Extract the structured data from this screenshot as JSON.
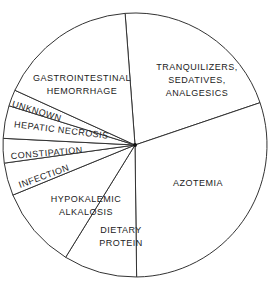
{
  "chart_data": {
    "type": "pie",
    "title": "",
    "center": [
      135,
      145
    ],
    "radius": 132,
    "start_angle_deg": 94.3,
    "direction": "clockwise",
    "categories": [
      "Tranquilizers, sedatives, analgesics",
      "Azotemia",
      "Dietary protein",
      "Hypokalemic alkalosis",
      "Infection",
      "Constipation",
      "Hepatic necrosis",
      "Unknown",
      "Gastrointestinal hemorrhage"
    ],
    "values": [
      21,
      30,
      9,
      10,
      4,
      3,
      4,
      2,
      17
    ],
    "value_unit": "approx. percent of cases (estimated from slice angles)",
    "legend": "none (labels inside slices)",
    "labels": [
      {
        "lines": [
          "TRANQUILIZERS,",
          "SEDATIVES,",
          "ANALGESICS"
        ],
        "x": 197,
        "y": 70,
        "rotate": 0
      },
      {
        "lines": [
          "AZOTEMIA"
        ],
        "x": 198,
        "y": 186,
        "rotate": 0
      },
      {
        "lines": [
          "DIETARY",
          "PROTEIN"
        ],
        "x": 121,
        "y": 233,
        "rotate": 0
      },
      {
        "lines": [
          "HYPOKALEMIC",
          "ALKALOSIS"
        ],
        "x": 86,
        "y": 202,
        "rotate": 0
      },
      {
        "lines": [
          "INFECTION"
        ],
        "x": 45,
        "y": 179,
        "rotate": -20
      },
      {
        "lines": [
          "CONSTIPATION"
        ],
        "x": 47,
        "y": 156,
        "rotate": -5
      },
      {
        "lines": [
          "HEPATIC NECROSIS"
        ],
        "x": 61,
        "y": 133,
        "rotate": 7
      },
      {
        "lines": [
          "UNKNOWN"
        ],
        "x": 36,
        "y": 114,
        "rotate": 17
      },
      {
        "lines": [
          "GASTROINTESTINAL",
          "HEMORRHAGE"
        ],
        "x": 82,
        "y": 81,
        "rotate": 0
      }
    ]
  }
}
